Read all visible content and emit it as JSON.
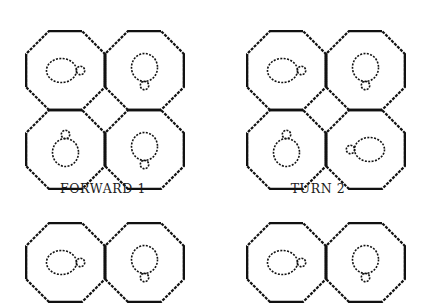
{
  "figures": [
    {
      "id": "forward-1",
      "caption": "FORWARD 1",
      "origin": [
        25,
        30
      ],
      "caption_pos": [
        103,
        181
      ],
      "rows": 2,
      "turtles": [
        "right",
        "down",
        "up",
        "down"
      ]
    },
    {
      "id": "turn-2",
      "caption": "TURN 2",
      "origin": [
        246,
        30
      ],
      "caption_pos": [
        318,
        181
      ],
      "rows": 2,
      "turtles": [
        "right",
        "down",
        "up",
        "left"
      ]
    },
    {
      "id": "bottom-left",
      "caption": "",
      "origin": [
        25,
        222
      ],
      "rows": 1,
      "turtles": [
        "right",
        "down"
      ]
    },
    {
      "id": "bottom-right",
      "caption": "",
      "origin": [
        246,
        222
      ],
      "rows": 1,
      "turtles": [
        "right",
        "down"
      ]
    }
  ],
  "style": {
    "ink": "#111111",
    "background": "#ffffff",
    "cell_size": 79
  }
}
